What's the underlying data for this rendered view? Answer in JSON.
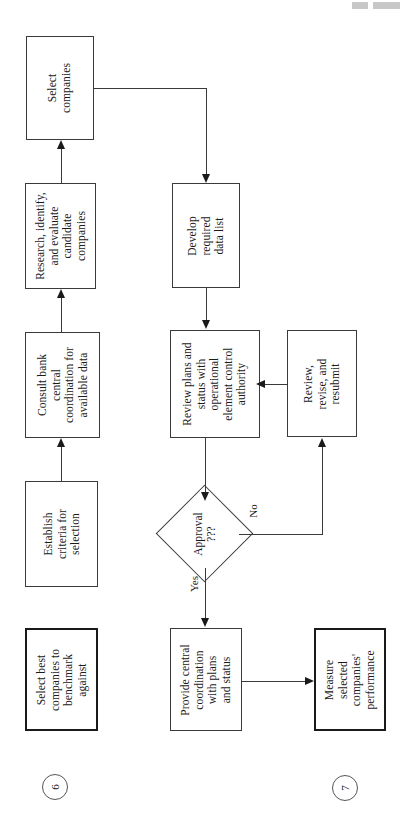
{
  "diagram": {
    "type": "flowchart",
    "orientation": "rotated-90-landscape-on-portrait-page",
    "nodes": [
      {
        "id": "select-companies",
        "label": "Select\ncompanies",
        "shape": "process"
      },
      {
        "id": "research-candidates",
        "label": "Research, identify,\nand evaluate\ncandidate\ncompanies",
        "shape": "process"
      },
      {
        "id": "consult-bank",
        "label": "Consult bank\ncentral\ncoordination for\navailable data",
        "shape": "process"
      },
      {
        "id": "establish-criteria",
        "label": "Establish\ncriteria for\nselection",
        "shape": "process"
      },
      {
        "id": "select-best-companies",
        "label": "Select best\ncompanies to\nbenchmark\nagainst",
        "shape": "process-bold"
      },
      {
        "id": "develop-data-list",
        "label": "Develop\nrequired\ndata list",
        "shape": "process"
      },
      {
        "id": "review-plans",
        "label": "Review plans and\nstatus with\noperational\nelement control\nauthority",
        "shape": "process"
      },
      {
        "id": "review-revise",
        "label": "Review,\nrevise, and\nresubmit",
        "shape": "process"
      },
      {
        "id": "approval-decision",
        "label": "Approval\n???",
        "shape": "decision"
      },
      {
        "id": "provide-coordination",
        "label": "Provide central\ncoordination\nwith plans\nand status",
        "shape": "process"
      },
      {
        "id": "measure-performance",
        "label": "Measure\nselected\ncompanies'\nperformance",
        "shape": "process-bold"
      }
    ],
    "edges": [
      {
        "from": "establish-criteria",
        "to": "consult-bank",
        "label": ""
      },
      {
        "from": "consult-bank",
        "to": "research-candidates",
        "label": ""
      },
      {
        "from": "research-candidates",
        "to": "select-companies",
        "label": ""
      },
      {
        "from": "select-companies",
        "to": "develop-data-list",
        "label": ""
      },
      {
        "from": "develop-data-list",
        "to": "review-plans",
        "label": ""
      },
      {
        "from": "review-plans",
        "to": "approval-decision",
        "label": ""
      },
      {
        "from": "approval-decision",
        "to": "review-revise",
        "label": "No"
      },
      {
        "from": "review-revise",
        "to": "review-plans",
        "label": ""
      },
      {
        "from": "approval-decision",
        "to": "provide-coordination",
        "label": "Yes"
      },
      {
        "from": "provide-coordination",
        "to": "measure-performance",
        "label": ""
      }
    ],
    "edge_labels": {
      "no": "No",
      "yes": "Yes"
    },
    "page_markers": [
      {
        "id": "marker-6",
        "label": "6"
      },
      {
        "id": "marker-7",
        "label": "7"
      }
    ],
    "colors": {
      "stroke": "#3a3a3a",
      "stroke_bold": "#1a1a1a",
      "background": "#ffffff",
      "text": "#1a1a1a"
    }
  }
}
